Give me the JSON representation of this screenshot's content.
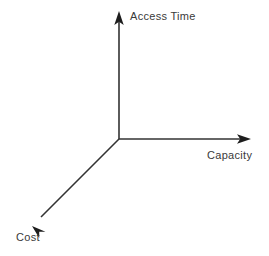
{
  "diagram": {
    "type": "three-axis-tradeoff-diagram",
    "background_color": "#ffffff",
    "line_color": "#333333",
    "text_color": "#3a3a3a",
    "width": 269,
    "height": 256,
    "origin": {
      "x": 119,
      "y": 139
    },
    "axes": [
      {
        "id": "access-time",
        "label": "Access Time",
        "direction": "up",
        "tip": {
          "x": 119,
          "y": 12
        },
        "label_position": {
          "x": 130,
          "y": 11
        }
      },
      {
        "id": "capacity",
        "label": "Capacity",
        "direction": "right",
        "tip": {
          "x": 250,
          "y": 139
        },
        "label_position": {
          "x": 207,
          "y": 150
        }
      },
      {
        "id": "cost",
        "label": "Cost",
        "direction": "down-left",
        "tip": {
          "x": 33,
          "y": 225
        },
        "label_position": {
          "x": 16,
          "y": 232
        }
      }
    ]
  }
}
